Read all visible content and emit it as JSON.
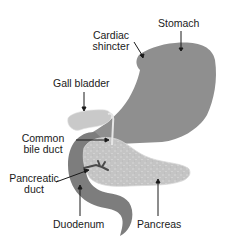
{
  "diagram": {
    "type": "anatomy",
    "colors": {
      "background": "#ffffff",
      "stomach": "#8f8f8f",
      "duodenum": "#7d7d7d",
      "gall_bladder": "#c9c9c9",
      "pancreas": "#c4c4c4",
      "pancreatic_duct": "#4a4a4a",
      "text": "#1a1a1a",
      "arrow": "#1a1a1a"
    },
    "labels": {
      "stomach": "Stomach",
      "cardiac_sphincter_line1": "Cardiac",
      "cardiac_sphincter_line2": "shincter",
      "gall_bladder": "Gall bladder",
      "common_bile_duct_line1": "Common",
      "common_bile_duct_line2": "bile duct",
      "pancreatic_duct_line1": "Pancreatic",
      "pancreatic_duct_line2": "duct",
      "duodenum": "Duodenum",
      "pancreas": "Pancreas"
    }
  }
}
